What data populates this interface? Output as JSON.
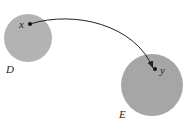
{
  "diagram": {
    "sets": [
      {
        "label": "D",
        "color": "#b3b3b3"
      },
      {
        "label": "E",
        "color": "#a6a6a6"
      }
    ],
    "points": [
      {
        "label": "x"
      },
      {
        "label": "y"
      }
    ],
    "arrow": {
      "from": "x",
      "to": "y",
      "color": "#222222"
    }
  }
}
